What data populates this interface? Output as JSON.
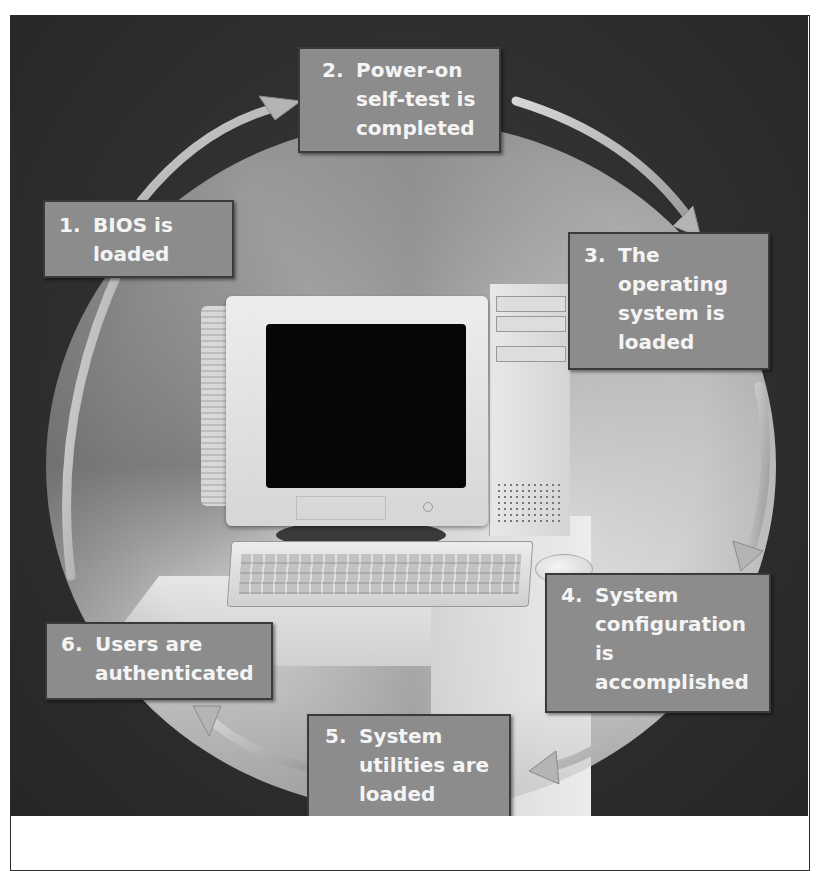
{
  "diagram": {
    "steps": [
      {
        "number": "1.",
        "text": "BIOS is\nloaded"
      },
      {
        "number": "2.",
        "text": "Power-on\nself-test is\ncompleted"
      },
      {
        "number": "3.",
        "text": "The\noperating\nsystem is\nloaded"
      },
      {
        "number": "4.",
        "text": "System\nconfiguration\nis\naccomplished"
      },
      {
        "number": "5.",
        "text": "System\nutilities are\nloaded"
      },
      {
        "number": "6.",
        "text": "Users are\nauthenticated"
      }
    ],
    "center_image": "desktop-computer",
    "colors": {
      "background": "#2e2e2e",
      "label_fill": "#8c8c8c",
      "label_text": "#f4f4f4",
      "arrow": "#bdbdbd"
    }
  }
}
